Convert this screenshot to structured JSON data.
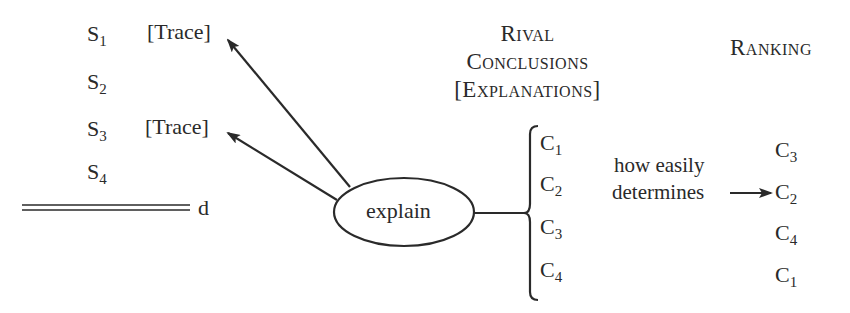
{
  "evidence": {
    "items": [
      {
        "base": "S",
        "sub": "1",
        "trace": "[Trace]"
      },
      {
        "base": "S",
        "sub": "2",
        "trace": ""
      },
      {
        "base": "S",
        "sub": "3",
        "trace": "[Trace]"
      },
      {
        "base": "S",
        "sub": "4",
        "trace": ""
      }
    ],
    "baseline_label": "d"
  },
  "process": {
    "label": "explain"
  },
  "rival_conclusions": {
    "header_lines": [
      "Rival",
      "Conclusions",
      "[Explanations]"
    ],
    "items": [
      {
        "base": "C",
        "sub": "1"
      },
      {
        "base": "C",
        "sub": "2"
      },
      {
        "base": "C",
        "sub": "3"
      },
      {
        "base": "C",
        "sub": "4"
      }
    ]
  },
  "criterion": {
    "line1": "how easily",
    "line2": "determines"
  },
  "ranking": {
    "header": "Ranking",
    "items": [
      {
        "base": "C",
        "sub": "3"
      },
      {
        "base": "C",
        "sub": "2"
      },
      {
        "base": "C",
        "sub": "4"
      },
      {
        "base": "C",
        "sub": "1"
      }
    ]
  },
  "colors": {
    "ink": "#2a2a2a",
    "background": "#ffffff"
  }
}
